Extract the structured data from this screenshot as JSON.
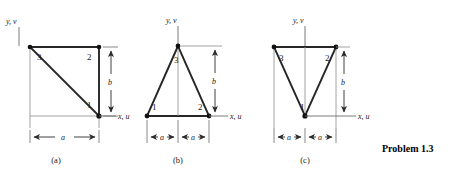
{
  "figure": {
    "problem_caption": "Problem 1.3",
    "axis_labels": {
      "vertical": "y, v",
      "horizontal": "x, u"
    },
    "dimension_labels": {
      "width": "a",
      "height": "b"
    },
    "panels": [
      {
        "caption": "(a)",
        "shape": "right-triangle",
        "nodes": [
          {
            "id": "1",
            "label": "1",
            "position": "bottom-right"
          },
          {
            "id": "2",
            "label": "2",
            "position": "top-right"
          },
          {
            "id": "3",
            "label": "3",
            "position": "top-left"
          }
        ],
        "width_dims": [
          "a"
        ],
        "height_dim": "b",
        "y_axis_label": "y, v",
        "x_axis_label": "x, u"
      },
      {
        "caption": "(b)",
        "shape": "isosceles-triangle-apex-up",
        "nodes": [
          {
            "id": "1",
            "label": "1",
            "position": "bottom-left"
          },
          {
            "id": "2",
            "label": "2",
            "position": "bottom-right"
          },
          {
            "id": "3",
            "label": "3",
            "position": "top-apex"
          }
        ],
        "width_dims": [
          "a",
          "a"
        ],
        "height_dim": "b",
        "y_axis_label": "y, v",
        "x_axis_label": "x, u"
      },
      {
        "caption": "(c)",
        "shape": "isosceles-triangle-apex-down",
        "nodes": [
          {
            "id": "1",
            "label": "1",
            "position": "bottom-apex"
          },
          {
            "id": "2",
            "label": "2",
            "position": "top-right"
          },
          {
            "id": "3",
            "label": "3",
            "position": "top-left"
          }
        ],
        "width_dims": [
          "a",
          "a"
        ],
        "height_dim": "b",
        "y_axis_label": "y, v",
        "x_axis_label": "x, u"
      }
    ],
    "colors": {
      "line": "#262626",
      "thin_line": "#6b6b6b",
      "node": "#111111",
      "text": "#1a1a1a",
      "background": "#ffffff"
    }
  }
}
